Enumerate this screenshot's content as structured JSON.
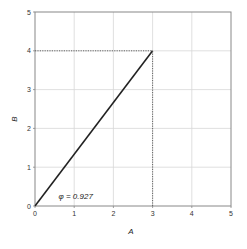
{
  "chart_data": {
    "type": "line",
    "title": "",
    "xlabel": "A",
    "ylabel": "B",
    "xlim": [
      0,
      5
    ],
    "ylim": [
      0,
      5
    ],
    "grid": true,
    "legend": null,
    "x_ticks": [
      "0",
      "1",
      "2",
      "3",
      "4",
      "5"
    ],
    "y_ticks": [
      "0",
      "1",
      "2",
      "3",
      "4",
      "5"
    ],
    "series": [
      {
        "name": "vector",
        "style": "solid",
        "color": "#222222",
        "x": [
          0,
          3
        ],
        "y": [
          0,
          4
        ]
      },
      {
        "name": "projection-horizontal",
        "style": "dotted",
        "color": "#555555",
        "x": [
          0,
          3
        ],
        "y": [
          4,
          4
        ]
      },
      {
        "name": "projection-vertical",
        "style": "dotted",
        "color": "#555555",
        "x": [
          3,
          3
        ],
        "y": [
          0,
          4
        ]
      }
    ],
    "annotations": [
      {
        "text": "φ = 0.927",
        "x": 0.6,
        "y": 0.18
      }
    ]
  },
  "colors": {
    "grid": "#d8d8d8",
    "frame": "#888888",
    "line": "#222222",
    "projection": "#555555"
  }
}
